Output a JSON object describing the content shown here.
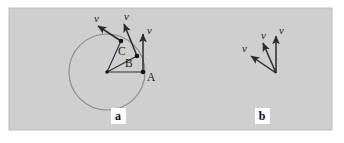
{
  "figure": {
    "background_color": "#ffffff",
    "panel_color": "#cfcfcf",
    "panel_border_color": "#bdbdbd",
    "circle_color": "#8a8a8a",
    "arrow_color": "#2b2b2b",
    "dot_color": "#141414",
    "label_box_color": "#ffffff",
    "panel_rect": {
      "x": 9,
      "y": 8,
      "width": 323,
      "height": 122
    }
  },
  "panels": [
    {
      "id": "panel-a",
      "label": "a",
      "label_pos": {
        "x": 118,
        "y": 120
      },
      "description": "Particle on a circular path with velocity vectors tangent at points A, B and C",
      "circle": {
        "cx": 107,
        "cy": 72,
        "r": 38
      },
      "center": {
        "x": 107,
        "y": 72
      },
      "points": [
        {
          "name": "A",
          "label": "A",
          "pos": {
            "x": 143,
            "y": 72
          },
          "label_pos": {
            "x": 147,
            "y": 80
          },
          "radius_line": {
            "x1": 107,
            "y1": 72,
            "x2": 143,
            "y2": 72
          },
          "vector": {
            "x1": 143,
            "y1": 72,
            "x2": 143,
            "y2": 33
          },
          "vector_label": "v",
          "vector_label_pos": {
            "x": 147,
            "y": 33
          }
        },
        {
          "name": "B",
          "label": "B",
          "pos": {
            "x": 137,
            "y": 56
          },
          "label_pos": {
            "x": 126,
            "y": 66
          },
          "radius_line": {
            "x1": 107,
            "y1": 72,
            "x2": 137,
            "y2": 56
          },
          "vector": {
            "x1": 137,
            "y1": 56,
            "x2": 123,
            "y2": 22
          },
          "vector_label": "v",
          "vector_label_pos": {
            "x": 125,
            "y": 19
          }
        },
        {
          "name": "C",
          "label": "C",
          "pos": {
            "x": 121,
            "y": 41
          },
          "label_pos": {
            "x": 120,
            "y": 54
          },
          "radius_line": {
            "x1": 107,
            "y1": 72,
            "x2": 121,
            "y2": 41
          },
          "vector": {
            "x1": 121,
            "y1": 41,
            "x2": 96,
            "y2": 24
          },
          "vector_label": "v",
          "vector_label_pos": {
            "x": 96,
            "y": 20
          }
        }
      ]
    },
    {
      "id": "panel-b",
      "label": "b",
      "label_pos": {
        "x": 262,
        "y": 120
      },
      "description": "The same three velocity vectors redrawn from a common origin",
      "origin": {
        "x": 276,
        "y": 73
      },
      "vectors": [
        {
          "name": "v-a",
          "from_point": "A",
          "line": {
            "x1": 276,
            "y1": 73,
            "x2": 276,
            "y2": 35
          },
          "label": "v",
          "label_pos": {
            "x": 279,
            "y": 33
          }
        },
        {
          "name": "v-b",
          "from_point": "B",
          "line": {
            "x1": 276,
            "y1": 73,
            "x2": 262,
            "y2": 41
          },
          "label": "v",
          "label_pos": {
            "x": 262,
            "y": 38
          }
        },
        {
          "name": "v-c",
          "from_point": "C",
          "line": {
            "x1": 276,
            "y1": 73,
            "x2": 249,
            "y2": 55
          },
          "label": "v",
          "label_pos": {
            "x": 243,
            "y": 51
          }
        }
      ]
    }
  ]
}
